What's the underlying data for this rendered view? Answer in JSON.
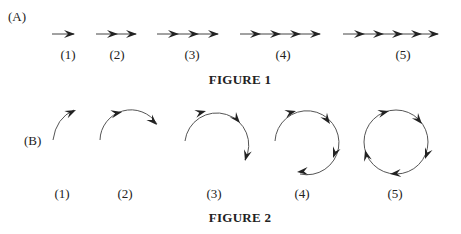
{
  "figure1": {
    "part_label": "(A)",
    "caption": "FIGURE 1",
    "items": [
      {
        "label": "(1)",
        "arrows": 1
      },
      {
        "label": "(2)",
        "arrows": 2
      },
      {
        "label": "(3)",
        "arrows": 3
      },
      {
        "label": "(4)",
        "arrows": 4
      },
      {
        "label": "(5)",
        "arrows": 5
      }
    ]
  },
  "figure2": {
    "part_label": "(B)",
    "caption": "FIGURE 2",
    "items": [
      {
        "label": "(1)",
        "arc_arrows": 1
      },
      {
        "label": "(2)",
        "arc_arrows": 2
      },
      {
        "label": "(3)",
        "arc_arrows": 3
      },
      {
        "label": "(4)",
        "arc_arrows": 4
      },
      {
        "label": "(5)",
        "arc_arrows": 5
      }
    ]
  },
  "colors": {
    "ink": "#222222",
    "line": "#555555",
    "background": "#ffffff"
  }
}
